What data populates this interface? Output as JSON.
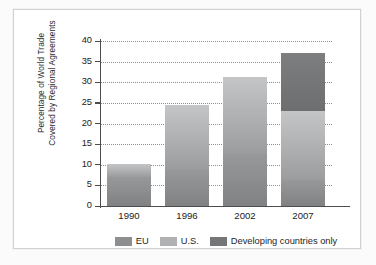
{
  "chart_data": {
    "type": "bar",
    "subtype": "stacked",
    "title": "",
    "xlabel": "",
    "ylabel": "Percentage of World Trade Covered by Regional Agreements",
    "ylabel_lines": [
      "Percentage of World Trade",
      "Covered by Regional Agreements"
    ],
    "categories": [
      "1990",
      "1996",
      "2002",
      "2007"
    ],
    "ylim": [
      0,
      40
    ],
    "yticks": [
      0,
      5,
      10,
      15,
      20,
      25,
      30,
      35,
      40
    ],
    "ytick_labels": [
      "0",
      "5",
      "10",
      "15",
      "20",
      "25",
      "30",
      "35",
      "40"
    ],
    "grid": "horizontal-dotted",
    "legend_position": "bottom-center",
    "series": [
      {
        "name": "EU",
        "color": "#8d8e90",
        "values": [
          7.0,
          8.7,
          12.6,
          6.3
        ]
      },
      {
        "name": "U.S.",
        "color": "#b0b1b3",
        "values": [
          3.2,
          15.8,
          18.7,
          16.7
        ]
      },
      {
        "name": "Developing countries only",
        "color": "#75767 8",
        "values": [
          0,
          0,
          0,
          14.0
        ]
      }
    ],
    "totals": [
      10.2,
      24.5,
      31.3,
      37.0
    ]
  },
  "legend": {
    "items": [
      {
        "label": "EU",
        "color": "#8d8e90"
      },
      {
        "label": "U.S.",
        "color": "#b0b1b3"
      },
      {
        "label": "Developing countries only",
        "color": "#757678"
      }
    ]
  },
  "colors": {
    "axis": "#4d4d4d",
    "grid": "#8f8f8f",
    "frame": "#d2d2d2",
    "background": "#ffffff"
  }
}
